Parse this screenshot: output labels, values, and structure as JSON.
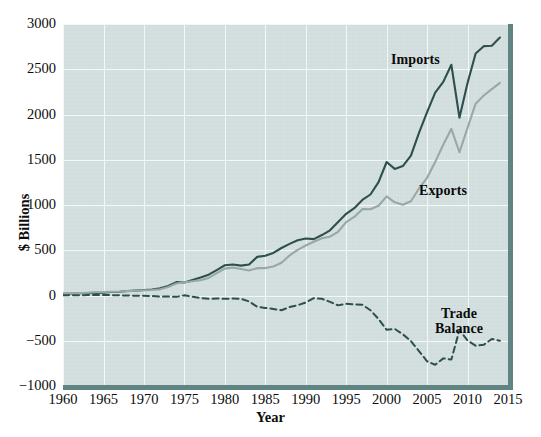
{
  "chart_data": {
    "type": "line",
    "title": "",
    "xlabel": "Year",
    "ylabel": "$ Billions",
    "xlim": [
      1960,
      2015
    ],
    "ylim": [
      -1000,
      3000
    ],
    "xticks": [
      "1960",
      "1965",
      "1970",
      "1975",
      "1980",
      "1985",
      "1990",
      "1995",
      "2000",
      "2005",
      "2010",
      "2015"
    ],
    "yticks": [
      "3000",
      "2500",
      "2000",
      "1500",
      "1000",
      "500",
      "0",
      "−500",
      "−1000"
    ],
    "grid": true,
    "legend_position": "inline-annotations",
    "x": [
      1960,
      1961,
      1962,
      1963,
      1964,
      1965,
      1966,
      1967,
      1968,
      1969,
      1970,
      1971,
      1972,
      1973,
      1974,
      1975,
      1976,
      1977,
      1978,
      1979,
      1980,
      1981,
      1982,
      1983,
      1984,
      1985,
      1986,
      1987,
      1988,
      1989,
      1990,
      1991,
      1992,
      1993,
      1994,
      1995,
      1996,
      1997,
      1998,
      1999,
      2000,
      2001,
      2002,
      2003,
      2004,
      2005,
      2006,
      2007,
      2008,
      2009,
      2010,
      2011,
      2012,
      2013,
      2014
    ],
    "series": [
      {
        "name": "Imports",
        "color": "#2d4f4d",
        "style": "solid",
        "values": [
          23,
          23,
          25,
          26,
          29,
          32,
          38,
          41,
          49,
          54,
          60,
          66,
          79,
          105,
          148,
          144,
          170,
          198,
          230,
          281,
          334,
          343,
          330,
          343,
          427,
          440,
          470,
          525,
          570,
          611,
          630,
          623,
          668,
          720,
          813,
          903,
          965,
          1056,
          1116,
          1252,
          1475,
          1399,
          1430,
          1545,
          1798,
          2027,
          2241,
          2360,
          2550,
          1965,
          2348,
          2675,
          2755,
          2760,
          2850
        ]
      },
      {
        "name": "Exports",
        "color": "#98a8a6",
        "style": "solid",
        "values": [
          26,
          27,
          28,
          31,
          36,
          38,
          42,
          44,
          48,
          52,
          57,
          60,
          68,
          94,
          133,
          146,
          157,
          170,
          194,
          248,
          297,
          310,
          293,
          277,
          302,
          303,
          321,
          362,
          443,
          504,
          552,
          594,
          632,
          650,
          704,
          811,
          868,
          954,
          953,
          992,
          1096,
          1030,
          1002,
          1041,
          1183,
          1300,
          1476,
          1665,
          1842,
          1583,
          1852,
          2120,
          2210,
          2280,
          2350
        ]
      },
      {
        "name": "Trade Balance",
        "color": "#2d4f4d",
        "style": "dashed",
        "values": [
          3,
          4,
          3,
          5,
          7,
          6,
          4,
          3,
          -1,
          -2,
          -3,
          -6,
          -11,
          -11,
          -15,
          2,
          -13,
          -28,
          -36,
          -33,
          -37,
          -33,
          -37,
          -66,
          -125,
          -137,
          -149,
          -163,
          -127,
          -107,
          -78,
          -29,
          -36,
          -70,
          -109,
          -92,
          -97,
          -102,
          -163,
          -260,
          -379,
          -369,
          -428,
          -504,
          -615,
          -727,
          -765,
          -695,
          -708,
          -382,
          -496,
          -555,
          -545,
          -480,
          -500
        ]
      }
    ],
    "annotations": [
      {
        "name": "imports-label",
        "text": "Imports"
      },
      {
        "name": "exports-label",
        "text": "Exports"
      },
      {
        "name": "trade-balance-label-line1",
        "text": "Trade"
      },
      {
        "name": "trade-balance-label-line2",
        "text": "Balance"
      }
    ],
    "colors": {
      "panel_background": "#d3dfdf",
      "gridline": "#f2f7f7",
      "frame_rule": "#5f8482",
      "imports": "#2d4f4d",
      "exports": "#98a8a6",
      "trade_balance": "#2d4f4d",
      "text": "#0c0c0c"
    }
  }
}
